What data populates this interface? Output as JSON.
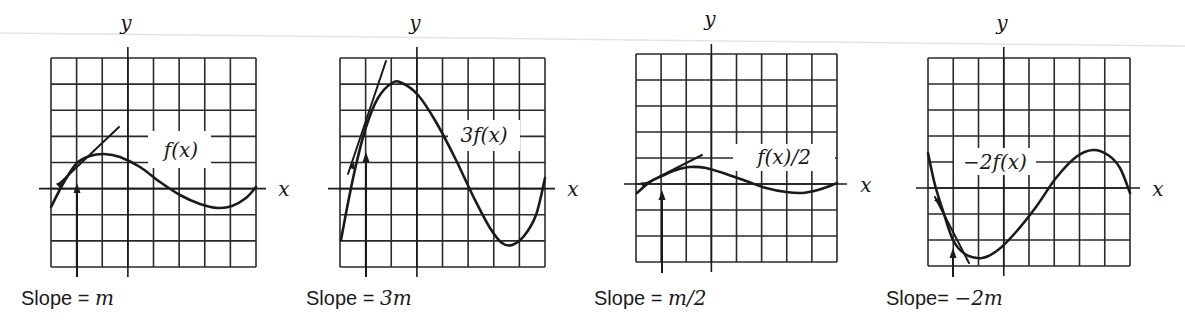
{
  "figure": {
    "colors": {
      "ink": "#1a1a1a",
      "grid": "#2a2a2a",
      "background": "#ffffff"
    },
    "axis_labels": {
      "x": "x",
      "y": "y"
    }
  },
  "chart_data": [
    {
      "type": "line",
      "title": "f(x)",
      "function_label": "f(x)",
      "slope_caption": {
        "prefix": "Slope = ",
        "value": "m"
      },
      "grid": {
        "left": 51,
        "top": 58,
        "right": 256,
        "bottom": 267,
        "cols": 8,
        "rows": 8,
        "x_axis_row": 5,
        "y_axis_col": 3
      },
      "axes": {
        "x_end": 266,
        "y_top": 47,
        "y_label": [
          126,
          30
        ],
        "x_label": [
          284,
          196
        ]
      },
      "curve": [
        [
          51,
          207
        ],
        [
          64,
          182
        ],
        [
          77,
          163
        ],
        [
          90,
          156
        ],
        [
          104,
          154
        ],
        [
          120,
          157
        ],
        [
          140,
          167
        ],
        [
          160,
          182
        ],
        [
          180,
          195
        ],
        [
          200,
          204
        ],
        [
          218,
          208
        ],
        [
          232,
          206
        ],
        [
          246,
          198
        ],
        [
          256,
          187
        ]
      ],
      "tangent": [
        [
          59,
          184
        ],
        [
          119,
          127
        ]
      ],
      "tangent_point": [
        77,
        163
      ],
      "arrow": {
        "x": 77,
        "from_y": 277,
        "to_y": 183
      },
      "tangent_arrowhead": [
        63,
        181
      ],
      "label_box": [
        148,
        131,
        63,
        37
      ],
      "label_pos": [
        181,
        157
      ],
      "caption_pos": [
        21,
        305
      ]
    },
    {
      "type": "line",
      "title": "3f(x)",
      "function_label": "3f(x)",
      "slope_caption": {
        "prefix": "Slope = ",
        "value": "3m"
      },
      "grid": {
        "left": 340,
        "top": 58,
        "right": 545,
        "bottom": 267,
        "cols": 8,
        "rows": 8,
        "x_axis_row": 5,
        "y_axis_col": 3
      },
      "axes": {
        "x_end": 555,
        "y_top": 47,
        "y_label": [
          415,
          30
        ],
        "x_label": [
          573,
          196
        ]
      },
      "curve": [
        [
          341,
          240
        ],
        [
          348,
          203
        ],
        [
          356,
          165
        ],
        [
          366,
          127
        ],
        [
          378,
          98
        ],
        [
          392,
          83
        ],
        [
          402,
          83
        ],
        [
          418,
          95
        ],
        [
          436,
          122
        ],
        [
          456,
          160
        ],
        [
          474,
          198
        ],
        [
          490,
          228
        ],
        [
          502,
          243
        ],
        [
          512,
          245
        ],
        [
          524,
          236
        ],
        [
          536,
          215
        ],
        [
          545,
          178
        ]
      ],
      "tangent": [
        [
          348,
          174
        ],
        [
          386,
          61
        ]
      ],
      "tangent_point": [
        366,
        127
      ],
      "arrow": {
        "x": 366,
        "from_y": 277,
        "to_y": 152
      },
      "tangent_arrowhead": [
        354,
        162
      ],
      "label_box": [
        448,
        120,
        72,
        31
      ],
      "label_pos": [
        484,
        142
      ],
      "caption_pos": [
        306,
        305
      ]
    },
    {
      "type": "line",
      "title": "f(x)/2",
      "function_label": "f(x)/2",
      "slope_caption": {
        "prefix": "Slope = ",
        "value": "m/2"
      },
      "grid": {
        "left": 636,
        "top": 54,
        "right": 837,
        "bottom": 262,
        "cols": 8,
        "rows": 8,
        "x_axis_row": 5,
        "y_axis_col": 3
      },
      "axes": {
        "x_end": 847,
        "y_top": 44,
        "y_label": [
          710,
          26
        ],
        "x_label": [
          866,
          192
        ]
      },
      "curve": [
        [
          637,
          193
        ],
        [
          650,
          182
        ],
        [
          662,
          176
        ],
        [
          676,
          170
        ],
        [
          690,
          167
        ],
        [
          706,
          168
        ],
        [
          726,
          174
        ],
        [
          746,
          181
        ],
        [
          766,
          188
        ],
        [
          786,
          192
        ],
        [
          802,
          193
        ],
        [
          818,
          190
        ],
        [
          830,
          186
        ],
        [
          837,
          183
        ]
      ],
      "tangent": [
        [
          645,
          184
        ],
        [
          702,
          155
        ]
      ],
      "tangent_point": [
        662,
        176
      ],
      "arrow": {
        "x": 662,
        "from_y": 273,
        "to_y": 190
      },
      "tangent_arrowhead": [
        648,
        182
      ],
      "label_box": [
        733,
        144,
        102,
        27
      ],
      "label_pos": [
        784,
        164
      ],
      "caption_pos": [
        594,
        305
      ]
    },
    {
      "type": "line",
      "title": "-2f(x)",
      "function_label": "−2f(x)",
      "slope_caption": {
        "prefix": "Slope= ",
        "value": "−2m"
      },
      "grid": {
        "left": 928,
        "top": 58,
        "right": 1130,
        "bottom": 266,
        "cols": 8,
        "rows": 8,
        "x_axis_row": 5,
        "y_axis_col": 3
      },
      "axes": {
        "x_end": 1140,
        "y_top": 47,
        "y_label": [
          1002,
          30
        ],
        "x_label": [
          1158,
          196
        ]
      },
      "curve": [
        [
          928,
          153
        ],
        [
          935,
          185
        ],
        [
          944,
          214
        ],
        [
          953,
          240
        ],
        [
          965,
          254
        ],
        [
          982,
          258
        ],
        [
          998,
          250
        ],
        [
          1016,
          232
        ],
        [
          1036,
          207
        ],
        [
          1056,
          178
        ],
        [
          1076,
          157
        ],
        [
          1093,
          150
        ],
        [
          1108,
          155
        ],
        [
          1120,
          168
        ],
        [
          1130,
          193
        ]
      ],
      "tangent": [
        [
          935,
          197
        ],
        [
          969,
          263
        ]
      ],
      "tangent_point": [
        953,
        240
      ],
      "arrow": {
        "x": 953,
        "from_y": 277,
        "to_y": 248
      },
      "tangent_arrowhead": [
        940,
        205
      ],
      "label_box": [
        954,
        148,
        82,
        27
      ],
      "label_pos": [
        995,
        169
      ],
      "caption_pos": [
        886,
        305
      ]
    }
  ]
}
